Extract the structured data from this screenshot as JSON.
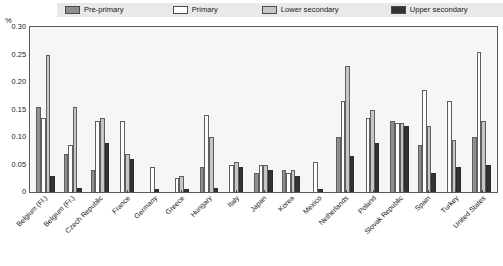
{
  "axis": {
    "y_unit": "%",
    "y_ticks": [
      "0.30",
      "0.25",
      "0.20",
      "0.15",
      "0.10",
      "0.05",
      "0"
    ]
  },
  "legend": {
    "items": [
      {
        "label": "Pre-primary",
        "key": "pre_primary",
        "color": "#8f8f8f"
      },
      {
        "label": "Primary",
        "key": "primary",
        "color": "#ffffff"
      },
      {
        "label": "Lower secondary",
        "key": "lower_secondary",
        "color": "#c6c6c6"
      },
      {
        "label": "Upper secondary",
        "key": "upper_secondary",
        "color": "#333333"
      }
    ]
  },
  "chart_data": {
    "type": "bar",
    "title": "",
    "xlabel": "",
    "ylabel": "%",
    "ylim": [
      0,
      0.3
    ],
    "yticks": [
      0,
      0.05,
      0.1,
      0.15,
      0.2,
      0.25,
      0.3
    ],
    "grid": false,
    "legend_position": "top",
    "categories": [
      "Belgium (Fl.)",
      "Belgium (Fr.)",
      "Czech Republic",
      "France",
      "Germany",
      "Greece",
      "Hungary",
      "Italy",
      "Japan",
      "Korea",
      "Mexico",
      "Netherlands",
      "Poland",
      "Slovak Republic",
      "Spain",
      "Turkey",
      "United States"
    ],
    "series": [
      {
        "name": "Pre-primary",
        "color": "#8f8f8f",
        "values": [
          0.155,
          0.07,
          0.04,
          0.0,
          0.0,
          0.0,
          0.045,
          0.0,
          0.035,
          0.04,
          0.0,
          0.1,
          0.0,
          0.13,
          0.085,
          0.0,
          0.1
        ]
      },
      {
        "name": "Primary",
        "color": "#ffffff",
        "values": [
          0.135,
          0.085,
          0.13,
          0.13,
          0.045,
          0.025,
          0.14,
          0.05,
          0.05,
          0.035,
          0.055,
          0.165,
          0.135,
          0.125,
          0.185,
          0.165,
          0.255
        ]
      },
      {
        "name": "Lower secondary",
        "color": "#c6c6c6",
        "values": [
          0.25,
          0.155,
          0.135,
          0.07,
          0.0,
          0.03,
          0.1,
          0.055,
          0.05,
          0.04,
          0.0,
          0.23,
          0.15,
          0.125,
          0.12,
          0.095,
          0.13
        ]
      },
      {
        "name": "Upper secondary",
        "color": "#333333",
        "values": [
          0.03,
          0.008,
          0.09,
          0.06,
          0.006,
          0.006,
          0.008,
          0.045,
          0.04,
          0.03,
          0.006,
          0.065,
          0.09,
          0.12,
          0.035,
          0.045,
          0.05
        ]
      }
    ]
  }
}
